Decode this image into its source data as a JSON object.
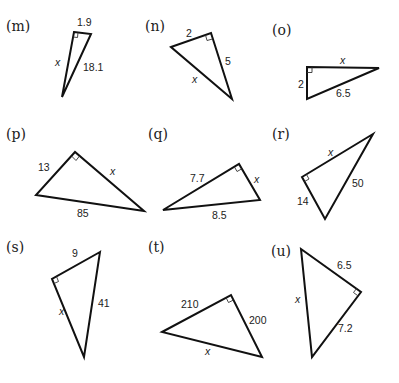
{
  "problems": [
    {
      "id": "m",
      "label": "(m)",
      "sides": {
        "leg_a": "1.9",
        "leg_b": "x",
        "hypotenuse": "18.1"
      },
      "unknown": "leg"
    },
    {
      "id": "n",
      "label": "(n)",
      "sides": {
        "leg_a": "2",
        "leg_b": "5",
        "hypotenuse": "x"
      },
      "unknown": "hypotenuse"
    },
    {
      "id": "o",
      "label": "(o)",
      "sides": {
        "leg_a": "2",
        "leg_b": "x",
        "hypotenuse": "6.5"
      },
      "unknown": "leg"
    },
    {
      "id": "p",
      "label": "(p)",
      "sides": {
        "leg_a": "13",
        "leg_b": "x",
        "hypotenuse": "85"
      },
      "unknown": "leg"
    },
    {
      "id": "q",
      "label": "(q)",
      "sides": {
        "leg_a": "7.7",
        "leg_b": "x",
        "hypotenuse": "8.5"
      },
      "unknown": "leg"
    },
    {
      "id": "r",
      "label": "(r)",
      "sides": {
        "leg_a": "14",
        "leg_b": "x",
        "hypotenuse": "50"
      },
      "unknown": "leg"
    },
    {
      "id": "s",
      "label": "(s)",
      "sides": {
        "leg_a": "9",
        "leg_b": "x",
        "hypotenuse": "41"
      },
      "unknown": "leg"
    },
    {
      "id": "t",
      "label": "(t)",
      "sides": {
        "leg_a": "210",
        "leg_b": "200",
        "hypotenuse": "x"
      },
      "unknown": "hypotenuse"
    },
    {
      "id": "u",
      "label": "(u)",
      "sides": {
        "leg_a": "6.5",
        "leg_b": "7.2",
        "hypotenuse": "x"
      },
      "unknown": "hypotenuse"
    }
  ],
  "colors": {
    "stroke": "#111111",
    "text": "#222222",
    "background": "#ffffff"
  }
}
